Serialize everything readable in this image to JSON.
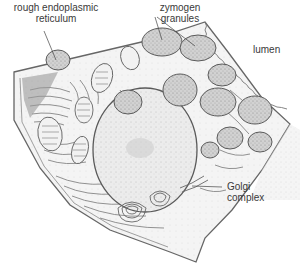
{
  "diagram": {
    "labels": {
      "rer_line1": "rough endoplasmic",
      "rer_line2": "reticulum",
      "zymogen_line1": "zymogen",
      "zymogen_line2": "granules",
      "lumen": "lumen",
      "golgi_line1": "Golgi",
      "golgi_line2": "complex"
    },
    "colors": {
      "ink": "#555555",
      "stipple": "#bdbdbd",
      "granule_fill": "#c9c9c9",
      "nucleus_fill": "#e2e2e2",
      "text": "#3a3a3a"
    }
  }
}
